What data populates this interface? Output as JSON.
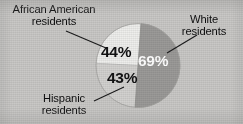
{
  "figure": {
    "background_color": "#c9c8c6",
    "media": "scanned-print-grayscale"
  },
  "labels": {
    "african_american": {
      "line1": "African American",
      "line2": "residents"
    },
    "white": {
      "line1": "White",
      "line2": "residents"
    },
    "hispanic": {
      "line1": "Hispanic",
      "line2": "residents"
    }
  },
  "values": {
    "african_american": "44%",
    "white": "69%",
    "hispanic": "43%"
  },
  "chart_data": {
    "type": "pie",
    "title": "",
    "subtitle": "",
    "xlabel": "",
    "ylabel": "",
    "legend_position": "callout-labels-with-leader-lines",
    "grid": false,
    "labels": [
      "White residents",
      "African American residents",
      "Hispanic residents"
    ],
    "values": [
      69,
      44,
      43
    ],
    "value_labels": [
      "69%",
      "44%",
      "43%"
    ],
    "units": "percent",
    "slice_colors": [
      "#9b9a98",
      "#eeeeec",
      "#d2d1cf"
    ],
    "slice_label_colors": [
      "#ffffff",
      "#121213",
      "#121213"
    ],
    "geometry": {
      "center_x": 138,
      "center_y": 65.5,
      "radius": 42,
      "wedges": [
        {
          "label": "White residents",
          "start_angle_deg": -86,
          "end_angle_deg": 94
        },
        {
          "label": "African American residents",
          "start_angle_deg": 183,
          "end_angle_deg": 274
        },
        {
          "label": "Hispanic residents",
          "start_angle_deg": 94,
          "end_angle_deg": 183
        }
      ]
    }
  },
  "leader_lines": [
    {
      "name": "african-american-leader",
      "x1": 66,
      "y1": 31,
      "x2": 106,
      "y2": 48
    },
    {
      "name": "white-leader",
      "x1": 197,
      "y1": 35,
      "x2": 167,
      "y2": 53
    },
    {
      "name": "hispanic-leader",
      "x1": 94,
      "y1": 101,
      "x2": 124,
      "y2": 87
    }
  ]
}
